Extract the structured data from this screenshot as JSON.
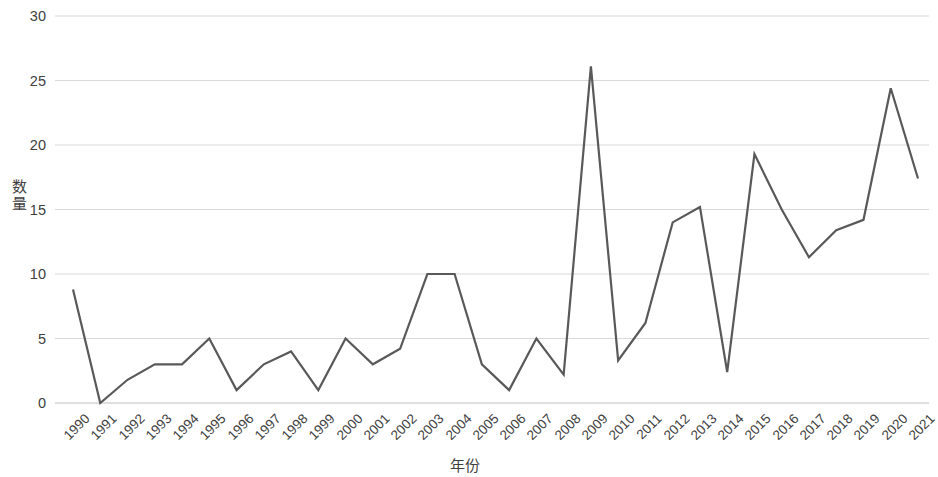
{
  "chart_data": {
    "type": "line",
    "title": "",
    "xlabel": "年份",
    "ylabel": "数量",
    "ylim": [
      0,
      30
    ],
    "yticks": [
      0,
      5,
      10,
      15,
      20,
      25,
      30
    ],
    "grid": true,
    "legend": false,
    "line_color": "#595959",
    "grid_color": "#d9d9d9",
    "axis_color": "#bfbfbf",
    "categories": [
      "1990",
      "1991",
      "1992",
      "1993",
      "1994",
      "1995",
      "1996",
      "1997",
      "1998",
      "1999",
      "2000",
      "2001",
      "2002",
      "2003",
      "2004",
      "2005",
      "2006",
      "2007",
      "2008",
      "2009",
      "2010",
      "2011",
      "2012",
      "2013",
      "2014",
      "2015",
      "2016",
      "2017",
      "2018",
      "2019",
      "2020",
      "2021"
    ],
    "values": [
      8.8,
      0,
      1.8,
      3,
      3,
      5,
      1,
      3,
      4,
      1,
      5,
      3,
      4.2,
      10,
      10,
      3,
      1,
      5,
      2.2,
      26.1,
      3.3,
      6.2,
      14,
      15.2,
      2.4,
      19.3,
      15,
      11.3,
      13.4,
      14.2,
      24.4,
      17.4
    ]
  }
}
